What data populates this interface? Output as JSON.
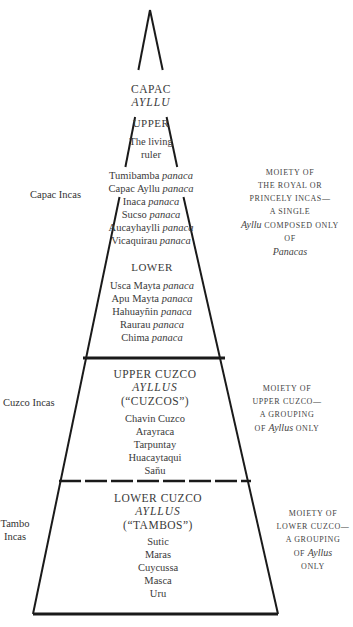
{
  "diagram": {
    "type": "pyramid",
    "apex": {
      "x": 150,
      "y": 10
    },
    "colors": {
      "line": "#1a1a1a",
      "text": "#3a3a3a",
      "background": "#ffffff"
    }
  },
  "capac_ayllu": {
    "title": "CAPAC",
    "subtitle": "AYLLU",
    "upper": {
      "heading": "UPPER",
      "lines": [
        "The living",
        "ruler"
      ],
      "panacas": [
        {
          "name": "Tumibamba",
          "suffix": "panaca"
        },
        {
          "name": "Capac Ayllu",
          "suffix": "panaca"
        },
        {
          "name": "Inaca",
          "suffix": "panaca"
        },
        {
          "name": "Sucso",
          "suffix": "panaca"
        },
        {
          "name": "Aucayhaylli",
          "suffix": "panaca"
        },
        {
          "name": "Vicaquirau",
          "suffix": "panaca"
        }
      ]
    },
    "lower": {
      "heading": "LOWER",
      "panacas": [
        {
          "name": "Usca Mayta",
          "suffix": "panaca"
        },
        {
          "name": "Apu Mayta",
          "suffix": "panaca"
        },
        {
          "name": "Hahuayñin",
          "suffix": "panaca"
        },
        {
          "name": "Raurau",
          "suffix": "panaca"
        },
        {
          "name": "Chima",
          "suffix": "panaca"
        }
      ]
    },
    "side_label": "Capac Incas",
    "note": {
      "line1": "MOIETY OF",
      "line2": "THE ROYAL OR",
      "line3": "PRINCELY INCAS—",
      "line4": "A SINGLE",
      "line5_italic": "Ayllu",
      "line5_rest": "COMPOSED ONLY",
      "line6": "OF",
      "line7_italic": "Panacas"
    }
  },
  "upper_cuzco": {
    "heading": "UPPER CUZCO",
    "subheading": "AYLLUS",
    "alias": "(“CUZCOS”)",
    "ayllus": [
      "Chavin Cuzco",
      "Arayraca",
      "Tarpuntay",
      "Huacaytaqui",
      "Saňu"
    ],
    "side_label": "Cuzco Incas",
    "note": {
      "line1": "MOIETY OF",
      "line2": "UPPER CUZCO—",
      "line3": "A GROUPING",
      "line4_pre": "OF",
      "line4_italic": "Ayllus",
      "line4_post": "ONLY"
    }
  },
  "lower_cuzco": {
    "heading": "LOWER CUZCO",
    "subheading": "AYLLUS",
    "alias": "(“TAMBOS”)",
    "ayllus": [
      "Sutic",
      "Maras",
      "Cuycussa",
      "Masca",
      "Uru"
    ],
    "side_label_line1": "Tambo",
    "side_label_line2": "Incas",
    "note": {
      "line1": "MOIETY OF",
      "line2": "LOWER CUZCO—",
      "line3": "A GROUPING",
      "line4_pre": "OF",
      "line4_italic": "Ayllus",
      "line5": "ONLY"
    }
  }
}
